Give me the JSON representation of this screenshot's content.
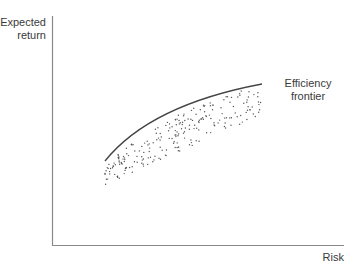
{
  "diagram": {
    "type": "scatter",
    "title": "",
    "ylabel_lines": [
      "Expected",
      "return"
    ],
    "xlabel": "Risk",
    "frontier_label_lines": [
      "Efficiency",
      "frontier"
    ],
    "colors": {
      "axis": "#8a8a8a",
      "curve": "#444444",
      "dots": "#555555",
      "text": "#3a3a3a"
    }
  },
  "chart_data": {
    "type": "scatter",
    "title": "",
    "xlabel": "Risk",
    "ylabel": "Expected return",
    "grid": false,
    "annotations": [
      "Efficiency frontier"
    ]
  }
}
